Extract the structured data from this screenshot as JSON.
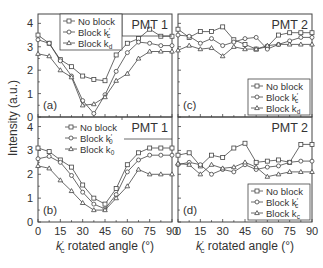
{
  "figure": {
    "ylabel": "Intensity (a.u.)",
    "xlabel_main": "k",
    "xlabel_sub": "c",
    "xlabel_prime": "′",
    "xlabel_rest": " rotated angle (°)"
  },
  "chart_data": [
    {
      "panel": "(a)",
      "title": "PMT 1",
      "type": "line",
      "xlabel": "k'c rotated angle (°)",
      "ylabel": "Intensity (a.u.)",
      "xlim": [
        0,
        90
      ],
      "ylim": [
        0,
        4.4
      ],
      "yticks": [
        0,
        1,
        2,
        3,
        4
      ],
      "legend_position": "top-left",
      "x": [
        0,
        7.5,
        15,
        22.5,
        30,
        37.5,
        45,
        52.5,
        60,
        67.5,
        75,
        82.5,
        90
      ],
      "series": [
        {
          "name": "No block",
          "marker": "square",
          "values": [
            3.5,
            3.15,
            2.45,
            2.15,
            1.75,
            1.6,
            1.55,
            2.65,
            3.15,
            3.35,
            3.75,
            3.45,
            3.45
          ]
        },
        {
          "name": "Block k'c",
          "marker": "circle",
          "values": [
            3.3,
            3.15,
            2.4,
            1.75,
            0.7,
            0.15,
            0.95,
            1.95,
            2.75,
            3.2,
            3.15,
            3.05,
            3.05
          ]
        },
        {
          "name": "Block kd",
          "marker": "triangle",
          "values": [
            2.7,
            2.6,
            2.0,
            1.7,
            0.5,
            0.55,
            0.85,
            1.55,
            1.85,
            2.5,
            2.8,
            2.8,
            2.8
          ]
        }
      ]
    },
    {
      "panel": "(b)",
      "title": "PMT 1",
      "type": "line",
      "xlabel": "k'c rotated angle (°)",
      "ylabel": "Intensity (a.u.)",
      "xlim": [
        0,
        90
      ],
      "ylim": [
        0,
        4.4
      ],
      "yticks": [
        0,
        1,
        2,
        3,
        4
      ],
      "xticks": [
        0,
        15,
        30,
        45,
        60,
        75,
        90
      ],
      "legend_position": "top-center",
      "x": [
        0,
        7.5,
        15,
        22.5,
        30,
        37.5,
        45,
        52.5,
        60,
        67.5,
        75,
        82.5,
        90
      ],
      "series": [
        {
          "name": "No block",
          "marker": "square",
          "values": [
            3.1,
            2.95,
            2.6,
            2.3,
            1.55,
            1.0,
            0.75,
            1.4,
            2.4,
            2.9,
            3.1,
            3.1,
            3.1
          ]
        },
        {
          "name": "Block k'0",
          "marker": "circle",
          "values": [
            2.65,
            2.75,
            2.5,
            1.95,
            1.25,
            0.75,
            0.55,
            1.15,
            2.1,
            2.6,
            2.8,
            2.8,
            2.8
          ]
        },
        {
          "name": "Block k0",
          "marker": "triangle",
          "values": [
            2.35,
            2.25,
            1.75,
            1.3,
            0.8,
            0.5,
            0.5,
            1.0,
            1.5,
            2.2,
            2.0,
            2.0,
            2.0
          ]
        }
      ]
    },
    {
      "panel": "(c)",
      "title": "PMT 2",
      "type": "line",
      "xlim": [
        0,
        90
      ],
      "ylim": [
        0,
        4.4
      ],
      "legend_position": "bottom-right",
      "x": [
        0,
        7.5,
        15,
        22.5,
        30,
        37.5,
        45,
        52.5,
        60,
        67.5,
        75,
        82.5,
        90
      ],
      "series": [
        {
          "name": "No block",
          "marker": "square",
          "values": [
            3.75,
            3.4,
            3.65,
            3.65,
            3.85,
            3.3,
            3.1,
            2.9,
            3.0,
            3.5,
            3.6,
            3.6,
            3.6
          ]
        },
        {
          "name": "Block k'c",
          "marker": "circle",
          "values": [
            3.5,
            3.45,
            3.15,
            3.35,
            3.05,
            3.2,
            3.35,
            3.4,
            2.9,
            3.1,
            3.25,
            3.4,
            3.4
          ]
        },
        {
          "name": "Block kd",
          "marker": "triangle",
          "values": [
            2.85,
            3.05,
            2.9,
            2.95,
            2.6,
            3.0,
            2.9,
            2.9,
            3.05,
            3.1,
            3.1,
            3.1,
            3.1
          ]
        }
      ]
    },
    {
      "panel": "(d)",
      "title": "PMT 2",
      "type": "line",
      "xlim": [
        0,
        90
      ],
      "ylim": [
        0,
        4.4
      ],
      "xticks": [
        0,
        15,
        30,
        45,
        60,
        75,
        90
      ],
      "legend_position": "bottom-right",
      "x": [
        0,
        7.5,
        15,
        22.5,
        30,
        37.5,
        45,
        52.5,
        60,
        67.5,
        75,
        82.5,
        90
      ],
      "series": [
        {
          "name": "No block",
          "marker": "square",
          "values": [
            2.8,
            2.9,
            2.35,
            2.8,
            2.7,
            3.1,
            3.3,
            2.5,
            2.55,
            2.6,
            2.5,
            3.25,
            3.25
          ]
        },
        {
          "name": "Block k'c",
          "marker": "circle",
          "values": [
            2.4,
            2.5,
            2.4,
            2.0,
            2.2,
            2.1,
            2.4,
            2.2,
            2.3,
            2.35,
            2.5,
            2.55,
            2.55
          ]
        },
        {
          "name": "Block kc",
          "marker": "triangle",
          "values": [
            2.45,
            2.4,
            2.0,
            2.4,
            2.25,
            2.3,
            2.5,
            2.3,
            1.9,
            2.0,
            2.1,
            2.1,
            2.1
          ]
        }
      ]
    }
  ],
  "panels": [
    {
      "label": "(a)",
      "pmt": "PMT 1",
      "legend": [
        {
          "text": "No block",
          "sub": ""
        },
        {
          "text": "Block k",
          "sub": "c",
          "prime": true
        },
        {
          "text": "Block k",
          "sub": "d",
          "prime": false
        }
      ]
    },
    {
      "label": "(b)",
      "pmt": "PMT 1",
      "legend": [
        {
          "text": "No block",
          "sub": ""
        },
        {
          "text": "Block k",
          "sub": "0",
          "prime": true
        },
        {
          "text": "Block k",
          "sub": "0",
          "prime": false
        }
      ]
    },
    {
      "label": "(c)",
      "pmt": "PMT 2",
      "legend": [
        {
          "text": "No block",
          "sub": ""
        },
        {
          "text": "Block k",
          "sub": "c",
          "prime": true
        },
        {
          "text": "Block k",
          "sub": "d",
          "prime": false
        }
      ]
    },
    {
      "label": "(d)",
      "pmt": "PMT 2",
      "legend": [
        {
          "text": "No block",
          "sub": ""
        },
        {
          "text": "Block k",
          "sub": "c",
          "prime": true
        },
        {
          "text": "Block k",
          "sub": "c",
          "prime": false
        }
      ]
    }
  ],
  "yticks": [
    "0",
    "1",
    "2",
    "3",
    "4"
  ],
  "xticks": [
    "0",
    "15",
    "30",
    "45",
    "60",
    "75",
    "90"
  ]
}
